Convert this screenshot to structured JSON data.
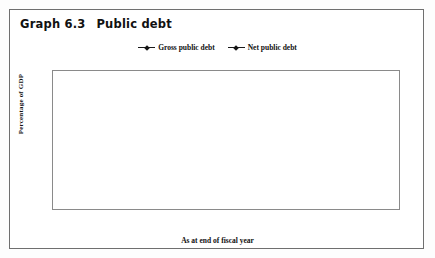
{
  "title": {
    "number": "Graph 6.3",
    "text": "Public debt"
  },
  "chart_data": {
    "type": "line",
    "title": "Public debt",
    "xlabel": "As at end of fiscal year",
    "ylabel": "Percentage of GDP",
    "ylim": [
      0,
      90
    ],
    "yticks": [
      0,
      15,
      30,
      45,
      60,
      75,
      90
    ],
    "xlim": [
      59,
      99
    ],
    "xticks": [
      60,
      62,
      64,
      66,
      68,
      70,
      72,
      74,
      76,
      78,
      80,
      82,
      84,
      86,
      88,
      90,
      92,
      94,
      96,
      98
    ],
    "grid": "horizontal",
    "legend_position": "top-center",
    "x": [
      60,
      61,
      62,
      63,
      64,
      65,
      66,
      67,
      68,
      69,
      70,
      71,
      72,
      73,
      74,
      75,
      76,
      77,
      78,
      79,
      80,
      81,
      82,
      83,
      84,
      85,
      86,
      87,
      88,
      89,
      90,
      91,
      92,
      93,
      94,
      95,
      96,
      97,
      98
    ],
    "series": [
      {
        "name": "Gross public debt",
        "marker": "diamond",
        "color": "#151515",
        "values": [
          68.5,
          65.0,
          65.2,
          65.3,
          63.5,
          62.0,
          60.3,
          58.5,
          60.0,
          63.0,
          62.8,
          59.0,
          54.5,
          50.0,
          47.5,
          45.0,
          42.3,
          43.0,
          47.0,
          44.5,
          47.5,
          47.0,
          46.5,
          50.0,
          55.5,
          56.5,
          62.0,
          65.0,
          68.5,
          67.0,
          65.5,
          72.5,
          76.5,
          68.0,
          66.0,
          66.5,
          64.5,
          65.0,
          67.5
        ]
      },
      {
        "name": "Net public debt",
        "marker": "diamond",
        "color": "#151515",
        "values": [
          null,
          null,
          null,
          null,
          null,
          null,
          null,
          null,
          null,
          null,
          null,
          null,
          7.5,
          7.8,
          6.5,
          6.3,
          8.0,
          8.2,
          11.0,
          12.5,
          16.5,
          21.0,
          23.0,
          27.0,
          32.0,
          37.0,
          40.0,
          43.5,
          41.0,
          45.5,
          42.5,
          47.5,
          49.0,
          50.5,
          47.5,
          44.5,
          40.0,
          36.0,
          31.0
        ]
      }
    ],
    "series_tail": {
      "note": "values continue to 98",
      "gross_tail": [
        64.5,
        62.0,
        56.0,
        48.5,
        42.5,
        37.5,
        37.5
      ],
      "net_tail": [
        44.0,
        38.5,
        33.0,
        29.0,
        25.5,
        25.5
      ]
    }
  },
  "legend": [
    {
      "label": "Gross public debt"
    },
    {
      "label": "Net public debt"
    }
  ]
}
